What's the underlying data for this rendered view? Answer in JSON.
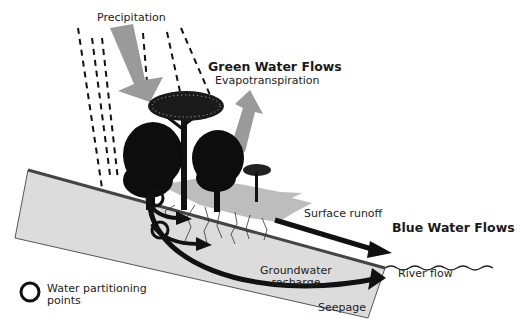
{
  "diagram": {
    "labels": {
      "precipitation": "Precipitation",
      "green_water_flows": "Green Water Flows",
      "evapotranspiration": "Evapotranspiration",
      "surface_runoff": "Surface runoff",
      "blue_water_flows": "Blue Water Flows",
      "groundwater_recharge_line1": "Groundwater",
      "groundwater_recharge_line2": "recharge",
      "river_flow": "River flow",
      "seepage": "Seepage"
    },
    "legend": {
      "symbol": "circle",
      "label_line1": "Water partitioning",
      "label_line2": "points"
    },
    "colors": {
      "ground_fill": "#dcdcdc",
      "ground_edge": "#555555",
      "arrow_gray": "#9a9a9a",
      "arrow_black": "#111111",
      "tree": "#0d0d0d",
      "text": "#222222"
    }
  }
}
